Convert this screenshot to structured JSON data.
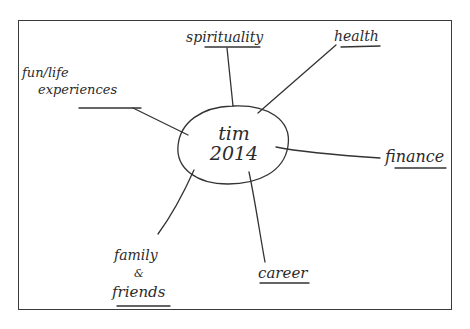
{
  "diagram": {
    "type": "mind-map",
    "style": "hand-drawn",
    "stroke_color": "#333333",
    "center": {
      "line1": "tim",
      "line2": "2014"
    },
    "branches": [
      {
        "id": "spirituality",
        "label": "spirituality",
        "underlined": true
      },
      {
        "id": "health",
        "label": "health",
        "underlined": true
      },
      {
        "id": "fun-life-experiences",
        "label_line1": "fun/life",
        "label_line2": "experiences",
        "underlined": true
      },
      {
        "id": "finance",
        "label": "finance",
        "underlined": true
      },
      {
        "id": "family-friends",
        "label_line1": "family",
        "label_line2": "&",
        "label_line3": "friends",
        "underlined": true
      },
      {
        "id": "career",
        "label": "career",
        "underlined": true
      }
    ]
  }
}
